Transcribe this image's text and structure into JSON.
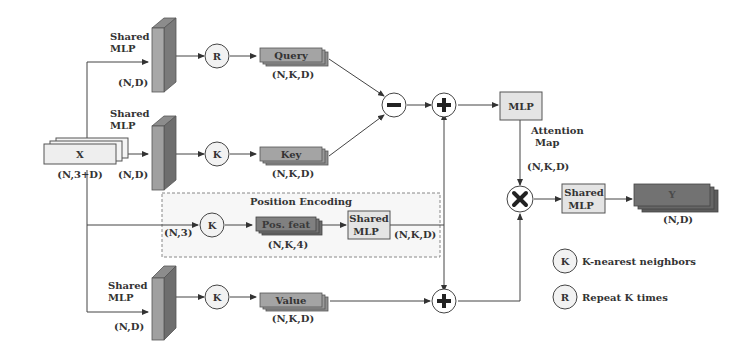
{
  "diagram": {
    "type": "neural-network-architecture",
    "input": {
      "label": "X",
      "shape": "(N,3+D)"
    },
    "branches": {
      "query": {
        "mlp_label": "Shared\nMLP",
        "mlp_label_line1": "Shared",
        "mlp_label_line2": "MLP",
        "mlp_shape": "(N,D)",
        "op": "R",
        "tensor_label": "Query",
        "tensor_shape": "(N,K,D)"
      },
      "key": {
        "mlp_label_line1": "Shared",
        "mlp_label_line2": "MLP",
        "mlp_shape": "(N,D)",
        "op": "K",
        "tensor_label": "Key",
        "tensor_shape": "(N,K,D)"
      },
      "position": {
        "group_title": "Position Encoding",
        "in_shape": "(N,3)",
        "op": "K",
        "tensor_label": "Pos. feat",
        "tensor_shape": "(N,K,4)",
        "mlp_label_line1": "Shared",
        "mlp_label_line2": "MLP",
        "out_shape": "(N,K,D)"
      },
      "value": {
        "mlp_label_line1": "Shared",
        "mlp_label_line2": "MLP",
        "mlp_shape": "(N,D)",
        "op": "K",
        "tensor_label": "Value",
        "tensor_shape": "(N,K,D)"
      }
    },
    "operators": {
      "subtract": "−",
      "add_top": "+",
      "add_bottom": "+",
      "multiply": "×"
    },
    "attention": {
      "mlp_label": "MLP",
      "map_label_line1": "Attention",
      "map_label_line2": "Map",
      "map_shape": "(N,K,D)"
    },
    "output": {
      "mlp_label_line1": "Shared",
      "mlp_label_line2": "MLP",
      "label": "Y",
      "shape": "(N,D)"
    },
    "legend": [
      {
        "symbol": "K",
        "text": "K-nearest neighbors"
      },
      {
        "symbol": "R",
        "text": "Repeat K times"
      }
    ],
    "colors": {
      "mlp_slab_front": "#a8a8a8",
      "mlp_slab_side": "#7a7a7a",
      "tensor_light": "#a0a0a0",
      "tensor_dark": "#707070",
      "box_fill": "#e4e4e4",
      "circle_fill": "#f2f2f2",
      "line": "#444444"
    }
  }
}
